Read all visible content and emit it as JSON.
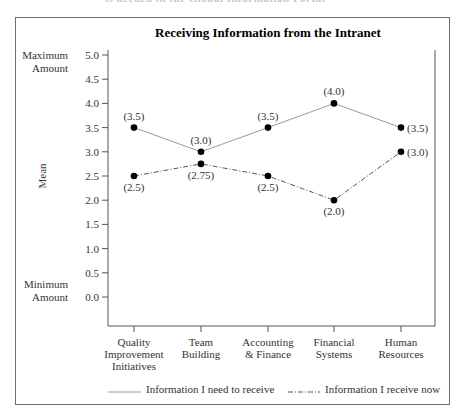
{
  "header_fragment": "is needed in the Global Information Portal",
  "chart_data": {
    "type": "line",
    "title": "Receiving Information from the Intranet",
    "xlabel": "",
    "ylabel": "Mean",
    "ylim": [
      0,
      5
    ],
    "y_ticks": [
      "0.0",
      "0.5",
      "1.0",
      "1.5",
      "2.0",
      "2.5",
      "3.0",
      "3.5",
      "4.0",
      "4.5",
      "5.0"
    ],
    "y_annotations": {
      "max": [
        "Maximum",
        "Amount"
      ],
      "min": [
        "Minimum",
        "Amount"
      ]
    },
    "categories": [
      [
        "Quality",
        "Improvement",
        "Initiatives"
      ],
      [
        "Team",
        "Building"
      ],
      [
        "Accounting",
        "& Finance"
      ],
      [
        "Financial",
        "Systems"
      ],
      [
        "Human",
        "Resources"
      ]
    ],
    "series": [
      {
        "name": "Information I need to receive",
        "style": "solid",
        "values": [
          3.5,
          3.0,
          3.5,
          4.0,
          3.5
        ],
        "labels": [
          "(3.5)",
          "(3.0)",
          "(3.5)",
          "(4.0)",
          "(3.5)"
        ]
      },
      {
        "name": "Information I receive now",
        "style": "dash-dot",
        "values": [
          2.5,
          2.75,
          2.5,
          2.0,
          3.0
        ],
        "labels": [
          "(2.5)",
          "(2.75)",
          "(2.5)",
          "(2.0)",
          "(3.0)"
        ]
      }
    ],
    "grid": false,
    "legend_position": "bottom"
  },
  "colors": {
    "line": "#8a8a8a",
    "marker": "#000000",
    "frame": "#6e6e6e"
  }
}
